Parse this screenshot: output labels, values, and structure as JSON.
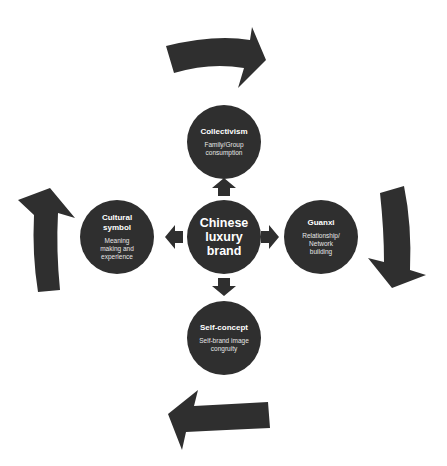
{
  "diagram": {
    "colors": {
      "fill": "#2f2f2f",
      "text": "#ffffff",
      "subtext": "#e6e6e6",
      "background": "#ffffff"
    },
    "center": {
      "title": "Chinese luxury brand"
    },
    "nodes": [
      {
        "id": "top",
        "title": "Collectivism",
        "subtitle": "Family/Group consumption"
      },
      {
        "id": "right",
        "title": "Guanxi",
        "subtitle": "Relationship/ Network building"
      },
      {
        "id": "bottom",
        "title": "Self-concept",
        "subtitle": "Self-brand image congruity"
      },
      {
        "id": "left",
        "title": "Cultural symbol",
        "subtitle": "Meaning making and experience"
      }
    ],
    "connectors": [
      "center-to-top",
      "center-to-right",
      "center-to-bottom",
      "center-to-left"
    ],
    "cycle_arrows": [
      "top-clockwise-right",
      "right-clockwise-down",
      "bottom-clockwise-left",
      "left-clockwise-up"
    ]
  }
}
